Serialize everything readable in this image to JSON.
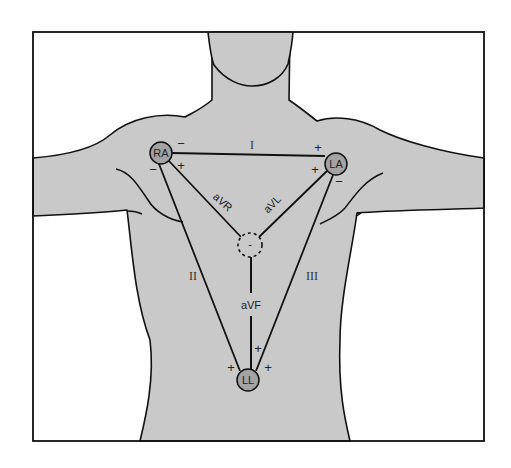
{
  "figure": {
    "colors": {
      "background": "#ffffff",
      "body_fill": "#c9c9c9",
      "electrode_fill": "#a3a3a3",
      "stroke": "#111111"
    }
  },
  "electrodes": [
    {
      "id": "RA",
      "label": "RA",
      "cx": 161,
      "cy": 153
    },
    {
      "id": "LA",
      "label": "LA",
      "cx": 336,
      "cy": 164
    },
    {
      "id": "LL",
      "label": "LL",
      "cx": 248,
      "cy": 380
    }
  ],
  "central_terminal": {
    "label": "-",
    "cx": 250,
    "cy": 245
  },
  "leads": {
    "I": {
      "label": "I"
    },
    "II": {
      "label": "II"
    },
    "III": {
      "label": "III"
    },
    "aVR": {
      "label": "aVR"
    },
    "aVL": {
      "label": "aVL"
    },
    "aVF": {
      "label": "aVF"
    }
  },
  "polarity_marks": {
    "ra_top": "−",
    "ra_left": "−",
    "ra_right": "+",
    "la_top": "+",
    "la_left": "+",
    "la_bottom": "−",
    "ll_left": "+",
    "ll_right": "+",
    "ll_top": "+"
  }
}
